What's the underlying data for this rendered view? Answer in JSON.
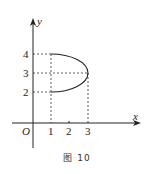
{
  "figure": {
    "caption": "图 10",
    "axes": {
      "x_label": "x",
      "y_label": "y",
      "origin_label": "O",
      "x_ticks": [
        "1",
        "2",
        "3"
      ],
      "y_ticks": [
        "2",
        "3",
        "4"
      ]
    },
    "curve": {
      "description": "right half of ellipse from (1,4) through (3,3) to (1,2)",
      "points": [
        [
          1,
          4
        ],
        [
          3,
          3
        ],
        [
          1,
          2
        ]
      ],
      "center": [
        1,
        3
      ],
      "semi_axis_x": 2,
      "semi_axis_y": 1
    },
    "dashed_guides": [
      {
        "from": [
          0,
          4
        ],
        "to": [
          1,
          4
        ]
      },
      {
        "from": [
          0,
          3
        ],
        "to": [
          3,
          3
        ]
      },
      {
        "from": [
          0,
          2
        ],
        "to": [
          1,
          2
        ]
      },
      {
        "from": [
          1,
          4
        ],
        "to": [
          1,
          0
        ]
      },
      {
        "from": [
          3,
          3
        ],
        "to": [
          3,
          0
        ]
      }
    ],
    "colors": {
      "stroke": "#222222",
      "background": "#ffffff"
    }
  }
}
